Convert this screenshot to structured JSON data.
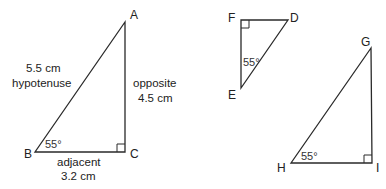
{
  "diagram": {
    "colors": {
      "line": "#2a2a2a",
      "text": "#222222",
      "background": "#ffffff"
    },
    "triangles": [
      {
        "id": "ABC",
        "vertices": {
          "A": [
            125,
            22
          ],
          "B": [
            35,
            152
          ],
          "C": [
            125,
            152
          ]
        },
        "right_angle_at": "C",
        "angle": {
          "vertex": "B",
          "label": "55°"
        },
        "labels": {
          "A": "A",
          "B": "B",
          "C": "C",
          "hypotenuse_length": "5.5 cm",
          "hypotenuse_name": "hypotenuse",
          "opposite_name": "opposite",
          "opposite_length": "4.5 cm",
          "adjacent_name": "adjacent",
          "adjacent_length": "3.2 cm"
        }
      },
      {
        "id": "DEF",
        "vertices": {
          "F": [
            241,
            20
          ],
          "D": [
            288,
            20
          ],
          "E": [
            241,
            88
          ]
        },
        "right_angle_at": "F",
        "angle": {
          "vertex": "E",
          "label": "55°"
        },
        "labels": {
          "D": "D",
          "E": "E",
          "F": "F"
        }
      },
      {
        "id": "GHI",
        "vertices": {
          "G": [
            371,
            48
          ],
          "H": [
            291,
            163
          ],
          "I": [
            372,
            163
          ]
        },
        "right_angle_at": "I",
        "angle": {
          "vertex": "H",
          "label": "55°"
        },
        "labels": {
          "G": "G",
          "H": "H",
          "I": "I"
        }
      }
    ]
  }
}
